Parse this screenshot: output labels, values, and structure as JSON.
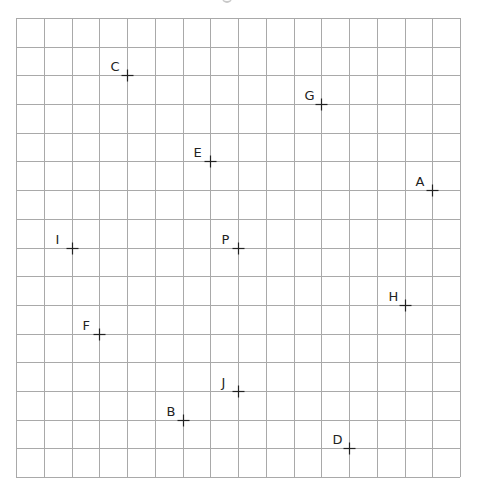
{
  "grid": {
    "columns": 16,
    "rows": 16,
    "origin_x": 16,
    "origin_y": 18,
    "cell_w": 27.75,
    "cell_h": 28.69,
    "line_color": "#a9a9a9",
    "line_width": 1
  },
  "marker": {
    "color": "#222222",
    "size": 6
  },
  "points": [
    {
      "label": "C",
      "col": 4,
      "row": 2
    },
    {
      "label": "G",
      "col": 11,
      "row": 3
    },
    {
      "label": "E",
      "col": 7,
      "row": 5
    },
    {
      "label": "A",
      "col": 15,
      "row": 6
    },
    {
      "label": "I",
      "col": 2,
      "row": 8
    },
    {
      "label": "P",
      "col": 8,
      "row": 8
    },
    {
      "label": "H",
      "col": 14,
      "row": 10
    },
    {
      "label": "F",
      "col": 3,
      "row": 11
    },
    {
      "label": "J",
      "col": 8,
      "row": 13
    },
    {
      "label": "B",
      "col": 6,
      "row": 14
    },
    {
      "label": "D",
      "col": 12,
      "row": 15
    }
  ]
}
